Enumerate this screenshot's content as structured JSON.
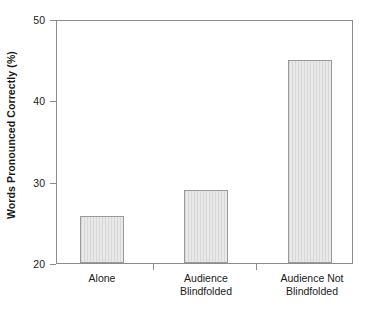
{
  "chart_data": {
    "type": "bar",
    "title": "",
    "xlabel": "",
    "ylabel": "Words Pronounced Correctly (%)",
    "categories": [
      "Alone",
      "Audience Blindfolded",
      "Audience Not Blindfolded"
    ],
    "category_lines": [
      [
        "Alone"
      ],
      [
        "Audience",
        "Blindfolded"
      ],
      [
        "Audience Not",
        "Blindfolded"
      ]
    ],
    "values": [
      25.8,
      29.0,
      45.0
    ],
    "ylim": [
      20,
      50
    ],
    "yticks": [
      20,
      30,
      40,
      50
    ],
    "ytick_labels": [
      "20",
      "30",
      "40",
      "50"
    ],
    "grid": false,
    "legend": "none",
    "bar_fill_color": "#dedede",
    "bar_edge_color": "#9a9a9a",
    "axis_color": "#8c8c8c",
    "background_color": "#ffffff"
  }
}
